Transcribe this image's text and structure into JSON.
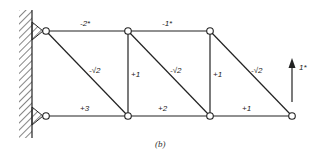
{
  "diagram": {
    "type": "truss",
    "caption": "(b)",
    "members": {
      "top_chord_1": "-2*",
      "top_chord_2": "-1*",
      "diagonal_1": "-√2",
      "diagonal_2": "-√2",
      "diagonal_3": "-√2",
      "vertical_1": "+1",
      "vertical_2": "+1",
      "bottom_chord_1": "+3",
      "bottom_chord_2": "+2",
      "bottom_chord_3": "+1"
    },
    "load": {
      "label": "1*",
      "direction": "up"
    },
    "support": "fixed-wall"
  }
}
